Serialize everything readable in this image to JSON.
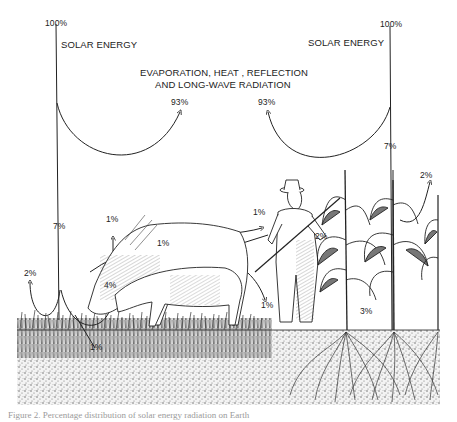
{
  "diagram": {
    "title": "Percentage distribution of solar energy radiation on Earth",
    "left_source": {
      "percent": "100%",
      "label": "SOLAR ENERGY"
    },
    "right_source": {
      "percent": "100%",
      "label": "SOLAR ENERGY"
    },
    "loss_label_line1": "EVAPORATION, HEAT , REFLECTION",
    "loss_label_line2": "AND LONG-WAVE RADIATION",
    "loss_left_percent": "93%",
    "loss_right_percent": "93%",
    "left_absorbed_percent": "7%",
    "right_absorbed_percent": "7%",
    "ground_reflect_percent": "2%",
    "cow_up_percent": "1%",
    "cow_side_percent": "1%",
    "cow_head_percent": "4%",
    "soil_percent": "1%",
    "farmer_percent": "1%",
    "farmer_down_percent": "1%",
    "corn_percent": "2%",
    "corn_root_percent": "3%",
    "right_edge_percent": "2%",
    "elements": [
      "cow",
      "farmer with pitchfork",
      "corn plants",
      "grass",
      "soil",
      "roots"
    ]
  },
  "caption": "Figure 2. Percentage distribution of solar energy radiation on Earth"
}
